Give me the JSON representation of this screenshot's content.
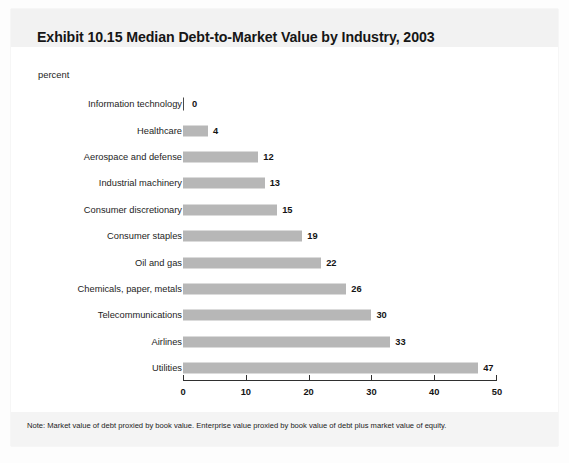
{
  "figure": {
    "title": "Exhibit 10.15 Median Debt-to-Market Value by Industry, 2003",
    "unit_label": "percent",
    "note": "Note: Market value of debt proxied by book value. Enterprise value proxied by book value of debt plus market value of equity."
  },
  "chart_data": {
    "type": "bar",
    "orientation": "horizontal",
    "title": "Exhibit 10.15 Median Debt-to-Market Value by Industry, 2003",
    "xlabel": "percent",
    "ylabel": "",
    "xlim": [
      0,
      50
    ],
    "xticks": [
      0,
      10,
      20,
      30,
      40,
      50
    ],
    "xtick_labels": [
      "0",
      "10",
      "20",
      "30",
      "40",
      "50"
    ],
    "grid": false,
    "legend": false,
    "bar_color": "#b7b7b7",
    "data_labels": true,
    "categories": [
      "Information technology",
      "Healthcare",
      "Aerospace and defense",
      "Industrial machinery",
      "Consumer discretionary",
      "Consumer staples",
      "Oil and gas",
      "Chemicals, paper, metals",
      "Telecommunications",
      "Airlines",
      "Utilities"
    ],
    "values": [
      0,
      4,
      12,
      13,
      15,
      19,
      22,
      26,
      30,
      33,
      47
    ],
    "value_labels": [
      "0",
      "4",
      "12",
      "13",
      "15",
      "19",
      "22",
      "26",
      "30",
      "33",
      "47"
    ]
  }
}
